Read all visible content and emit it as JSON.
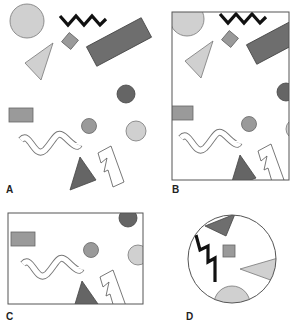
{
  "figure": {
    "panels": [
      {
        "id": "A",
        "label": "A",
        "frame": "none"
      },
      {
        "id": "B",
        "label": "B",
        "frame": "tall-rectangle"
      },
      {
        "id": "C",
        "label": "C",
        "frame": "wide-rectangle"
      },
      {
        "id": "D",
        "label": "D",
        "frame": "circle"
      }
    ],
    "colors": {
      "light_gray": "#d0d0d0",
      "mid_gray": "#9a9a9a",
      "dark_gray": "#6e6e6e",
      "darker_gray": "#656565",
      "outline": "#666666",
      "zigzag": "#111111",
      "frame": "#555555"
    }
  }
}
